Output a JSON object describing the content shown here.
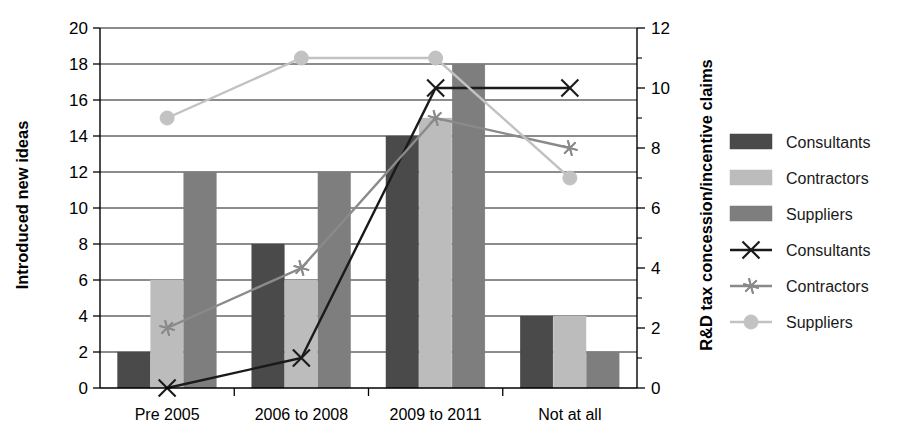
{
  "chart_data": {
    "type": "bar",
    "title": "",
    "categories": [
      "Pre 2005",
      "2006 to 2008",
      "2009 to 2011",
      "Not at all"
    ],
    "xlabel": "",
    "ylabel": "Introduced new ideas",
    "ylabel_secondary": "R&D tax concession/incentive claims",
    "ylim": [
      0,
      20
    ],
    "ylim_secondary": [
      0,
      12
    ],
    "yticks": [
      0,
      2,
      4,
      6,
      8,
      10,
      12,
      14,
      16,
      18,
      20
    ],
    "yticks_secondary": [
      0,
      2,
      4,
      6,
      8,
      10,
      12
    ],
    "yticks_secondary_minor": [
      1,
      3,
      5,
      7,
      9,
      11
    ],
    "grid": true,
    "grid_axis": "y",
    "legend_position": "right",
    "series": [
      {
        "name": "Consultants",
        "kind": "bar",
        "axis": "left",
        "color": "#4a4a4a",
        "values": [
          2,
          8,
          14,
          4
        ]
      },
      {
        "name": "Contractors",
        "kind": "bar",
        "axis": "left",
        "color": "#bcbcbc",
        "values": [
          6,
          6,
          15,
          4
        ]
      },
      {
        "name": "Suppliers",
        "kind": "bar",
        "axis": "left",
        "color": "#7e7e7e",
        "values": [
          12,
          12,
          18,
          2
        ]
      },
      {
        "name": "Consultants",
        "kind": "line",
        "axis": "right",
        "marker": "x",
        "color": "#1a1a1a",
        "values": [
          0,
          1,
          10,
          10
        ]
      },
      {
        "name": "Contractors",
        "kind": "line",
        "axis": "right",
        "marker": "asterisk",
        "color": "#8a8a8a",
        "values": [
          2,
          4,
          9,
          8
        ]
      },
      {
        "name": "Suppliers",
        "kind": "line",
        "axis": "right",
        "marker": "circle",
        "color": "#c2c2c2",
        "values": [
          9,
          11,
          11,
          7
        ]
      }
    ]
  },
  "axes": {
    "left_title": "Introduced new ideas",
    "right_title": "R&D tax concession/incentive claims",
    "left_ticks": [
      "0",
      "2",
      "4",
      "6",
      "8",
      "10",
      "12",
      "14",
      "16",
      "18",
      "20"
    ],
    "right_ticks": [
      "0",
      "2",
      "4",
      "6",
      "8",
      "10",
      "12"
    ],
    "categories": [
      "Pre 2005",
      "2006 to 2008",
      "2009 to 2011",
      "Not at all"
    ]
  },
  "legend": {
    "items": [
      {
        "label": "Consultants",
        "type": "swatch",
        "color": "#4a4a4a",
        "marker": ""
      },
      {
        "label": "Contractors",
        "type": "swatch",
        "color": "#bcbcbc",
        "marker": ""
      },
      {
        "label": "Suppliers",
        "type": "swatch",
        "color": "#7e7e7e",
        "marker": ""
      },
      {
        "label": "Consultants",
        "type": "line",
        "color": "#1a1a1a",
        "marker": "x"
      },
      {
        "label": "Contractors",
        "type": "line",
        "color": "#8a8a8a",
        "marker": "asterisk"
      },
      {
        "label": "Suppliers",
        "type": "line",
        "color": "#c2c2c2",
        "marker": "circle"
      }
    ]
  }
}
